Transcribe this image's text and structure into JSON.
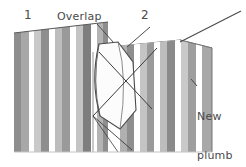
{
  "figure": {
    "kind": "wallpapering-instruction-diagram",
    "background_color": "#ffffff",
    "ink_color": "#4a4a4a",
    "line_color": "#3b3b3b"
  },
  "labels": {
    "strip_one": "1",
    "strip_two": "2",
    "overlap": "Overlap",
    "new_plumb_line": "New\nplumb\nline",
    "new_plumb_line_l1": "New",
    "new_plumb_line_l2": "plumb",
    "new_plumb_line_l3": "line"
  },
  "panels": {
    "left_panel": {
      "name": "strip-1-wall-panel",
      "x": 14,
      "y": 30,
      "width": 94,
      "height": 122,
      "stripes": [
        {
          "x": 14,
          "w": 7,
          "color": "#8e8e8e"
        },
        {
          "x": 21,
          "w": 8,
          "color": "#a8a8a8"
        },
        {
          "x": 29,
          "w": 5,
          "color": "#ffffff"
        },
        {
          "x": 34,
          "w": 7,
          "color": "#c9c9c9"
        },
        {
          "x": 41,
          "w": 8,
          "color": "#8e8e8e"
        },
        {
          "x": 49,
          "w": 6,
          "color": "#ffffff"
        },
        {
          "x": 55,
          "w": 7,
          "color": "#bdbdbd"
        },
        {
          "x": 62,
          "w": 8,
          "color": "#9a9a9a"
        },
        {
          "x": 70,
          "w": 6,
          "color": "#ffffff"
        },
        {
          "x": 76,
          "w": 7,
          "color": "#c4c4c4"
        },
        {
          "x": 83,
          "w": 8,
          "color": "#7e7e7e"
        },
        {
          "x": 91,
          "w": 6,
          "color": "#ffffff"
        },
        {
          "x": 97,
          "w": 6,
          "color": "#b4b4b4"
        },
        {
          "x": 103,
          "w": 5,
          "color": "#8e8e8e"
        }
      ]
    },
    "right_panel": {
      "name": "strip-2-wall-panel",
      "x": 120,
      "y": 40,
      "width": 92,
      "height": 112,
      "stripes": [
        {
          "x": 120,
          "w": 7,
          "color": "#b0b0b0"
        },
        {
          "x": 127,
          "w": 7,
          "color": "#8e8e8e"
        },
        {
          "x": 134,
          "w": 6,
          "color": "#ffffff"
        },
        {
          "x": 140,
          "w": 7,
          "color": "#c4c4c4"
        },
        {
          "x": 147,
          "w": 7,
          "color": "#9a9a9a"
        },
        {
          "x": 154,
          "w": 6,
          "color": "#ffffff"
        },
        {
          "x": 160,
          "w": 7,
          "color": "#bdbdbd"
        },
        {
          "x": 167,
          "w": 8,
          "color": "#8a8a8a"
        },
        {
          "x": 175,
          "w": 6,
          "color": "#ffffff"
        },
        {
          "x": 181,
          "w": 7,
          "color": "#c9c9c9"
        },
        {
          "x": 188,
          "w": 8,
          "color": "#9e9e9e"
        },
        {
          "x": 196,
          "w": 6,
          "color": "#ffffff"
        },
        {
          "x": 202,
          "w": 10,
          "color": "#a8a8a8"
        }
      ]
    },
    "block_top_face_color": "#c0c0c0",
    "block_side_face_color": "#d8d8d8",
    "flap_face_color": "#fdfdfd"
  },
  "leader_lines": {
    "overlap_leader": {
      "x1": 97,
      "y1": 24,
      "x2": 116,
      "y2": 44
    },
    "strip2_leader": {
      "x1": 150,
      "y1": 26,
      "x2": 126,
      "y2": 46
    },
    "plumb_leader": {
      "x1": 196,
      "y1": 84,
      "x2": 190,
      "y2": 76
    },
    "top_right_line": {
      "x1": 180,
      "y1": 42,
      "x2": 241,
      "y2": 11
    },
    "cross_a": {
      "x1": 99,
      "y1": 52,
      "x2": 152,
      "y2": 109
    },
    "cross_b": {
      "x1": 157,
      "y1": 48,
      "x2": 93,
      "y2": 116
    }
  }
}
